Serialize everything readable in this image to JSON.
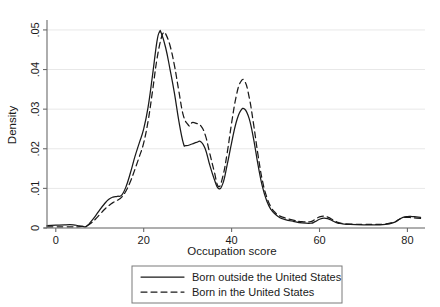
{
  "chart_data": {
    "type": "line",
    "title": "",
    "xlabel": "Occupation score",
    "ylabel": "Density",
    "xlim": [
      -2,
      84
    ],
    "ylim": [
      0,
      0.052
    ],
    "xticks": [
      0,
      20,
      40,
      60,
      80
    ],
    "xtick_labels": [
      "0",
      "20",
      "40",
      "60",
      "80"
    ],
    "yticks": [
      0,
      0.01,
      0.02,
      0.03,
      0.04,
      0.05
    ],
    "ytick_labels": [
      "0",
      ".01",
      ".02",
      ".03",
      ".04",
      ".05"
    ],
    "grid": "horizontal",
    "legend_position": "bottom-center",
    "series": [
      {
        "name": "Born outside the United States",
        "style": "solid",
        "color": "#1a1a1a",
        "points": [
          [
            -2,
            0.0006
          ],
          [
            0,
            0.0007
          ],
          [
            2,
            0.0008
          ],
          [
            4,
            0.0008
          ],
          [
            5,
            0.0006
          ],
          [
            6,
            0.0004
          ],
          [
            7,
            0.0004
          ],
          [
            8,
            0.0016
          ],
          [
            9,
            0.003
          ],
          [
            10,
            0.0046
          ],
          [
            11,
            0.006
          ],
          [
            12,
            0.0072
          ],
          [
            13,
            0.0078
          ],
          [
            14,
            0.008
          ],
          [
            15,
            0.0083
          ],
          [
            16,
            0.0105
          ],
          [
            17,
            0.014
          ],
          [
            18,
            0.018
          ],
          [
            19,
            0.0215
          ],
          [
            20,
            0.025
          ],
          [
            21,
            0.0305
          ],
          [
            22,
            0.0385
          ],
          [
            23,
            0.047
          ],
          [
            23.6,
            0.0495
          ],
          [
            24,
            0.0492
          ],
          [
            25,
            0.0455
          ],
          [
            26,
            0.04
          ],
          [
            27,
            0.034
          ],
          [
            28,
            0.027
          ],
          [
            29,
            0.0215
          ],
          [
            29.6,
            0.0208
          ],
          [
            31,
            0.0212
          ],
          [
            32,
            0.0216
          ],
          [
            33,
            0.0218
          ],
          [
            34,
            0.02
          ],
          [
            35,
            0.016
          ],
          [
            36,
            0.0125
          ],
          [
            37,
            0.01
          ],
          [
            38,
            0.0112
          ],
          [
            39,
            0.016
          ],
          [
            40,
            0.0215
          ],
          [
            41,
            0.0265
          ],
          [
            42,
            0.0295
          ],
          [
            43,
            0.03
          ],
          [
            44,
            0.0276
          ],
          [
            45,
            0.0225
          ],
          [
            46,
            0.016
          ],
          [
            47,
            0.0105
          ],
          [
            48,
            0.0068
          ],
          [
            49,
            0.0046
          ],
          [
            50,
            0.0034
          ],
          [
            51,
            0.0026
          ],
          [
            52,
            0.0022
          ],
          [
            54,
            0.0017
          ],
          [
            56,
            0.0013
          ],
          [
            58,
            0.0012
          ],
          [
            59,
            0.0016
          ],
          [
            60,
            0.0022
          ],
          [
            61,
            0.0025
          ],
          [
            62,
            0.0023
          ],
          [
            63,
            0.0018
          ],
          [
            64,
            0.0013
          ],
          [
            65,
            0.0011
          ],
          [
            67,
            0.0009
          ],
          [
            70,
            0.0008
          ],
          [
            73,
            0.0008
          ],
          [
            75,
            0.0009
          ],
          [
            77,
            0.0014
          ],
          [
            78,
            0.0021
          ],
          [
            79,
            0.0027
          ],
          [
            80,
            0.0029
          ],
          [
            81,
            0.0029
          ],
          [
            82,
            0.0028
          ],
          [
            83,
            0.0027
          ]
        ]
      },
      {
        "name": "Born in the United States",
        "style": "dashed",
        "color": "#1a1a1a",
        "points": [
          [
            -2,
            0.0003
          ],
          [
            0,
            0.0003
          ],
          [
            2,
            0.0003
          ],
          [
            4,
            0.0003
          ],
          [
            5,
            0.0003
          ],
          [
            6,
            0.0004
          ],
          [
            7,
            0.0006
          ],
          [
            8,
            0.0012
          ],
          [
            9,
            0.0022
          ],
          [
            10,
            0.0034
          ],
          [
            11,
            0.0046
          ],
          [
            12,
            0.0056
          ],
          [
            13,
            0.0064
          ],
          [
            14,
            0.007
          ],
          [
            15,
            0.0078
          ],
          [
            16,
            0.0094
          ],
          [
            17,
            0.0118
          ],
          [
            18,
            0.0148
          ],
          [
            19,
            0.018
          ],
          [
            20,
            0.0215
          ],
          [
            21,
            0.027
          ],
          [
            22,
            0.0345
          ],
          [
            23,
            0.0425
          ],
          [
            24,
            0.048
          ],
          [
            24.6,
            0.0493
          ],
          [
            25,
            0.049
          ],
          [
            26,
            0.046
          ],
          [
            27,
            0.041
          ],
          [
            28,
            0.0345
          ],
          [
            29,
            0.0285
          ],
          [
            30,
            0.0262
          ],
          [
            30.6,
            0.0258
          ],
          [
            31,
            0.0266
          ],
          [
            32,
            0.0264
          ],
          [
            33,
            0.0258
          ],
          [
            34,
            0.0235
          ],
          [
            35,
            0.019
          ],
          [
            36,
            0.0145
          ],
          [
            37,
            0.0105
          ],
          [
            38,
            0.013
          ],
          [
            39,
            0.019
          ],
          [
            40,
            0.0265
          ],
          [
            41,
            0.033
          ],
          [
            42,
            0.0368
          ],
          [
            43,
            0.037
          ],
          [
            44,
            0.033
          ],
          [
            45,
            0.0262
          ],
          [
            46,
            0.0185
          ],
          [
            47,
            0.012
          ],
          [
            48,
            0.0078
          ],
          [
            49,
            0.0052
          ],
          [
            50,
            0.0038
          ],
          [
            51,
            0.003
          ],
          [
            52,
            0.0026
          ],
          [
            54,
            0.002
          ],
          [
            56,
            0.0016
          ],
          [
            58,
            0.0016
          ],
          [
            59,
            0.0022
          ],
          [
            60,
            0.0028
          ],
          [
            61,
            0.003
          ],
          [
            62,
            0.0027
          ],
          [
            63,
            0.0021
          ],
          [
            64,
            0.0015
          ],
          [
            65,
            0.0012
          ],
          [
            67,
            0.001
          ],
          [
            70,
            0.0009
          ],
          [
            73,
            0.0009
          ],
          [
            75,
            0.001
          ],
          [
            77,
            0.0015
          ],
          [
            78,
            0.0021
          ],
          [
            79,
            0.0026
          ],
          [
            80,
            0.0027
          ],
          [
            81,
            0.0026
          ],
          [
            82,
            0.0025
          ],
          [
            83,
            0.0024
          ]
        ]
      }
    ]
  },
  "legend": {
    "entries": [
      {
        "label": "Born outside the United States",
        "style": "solid"
      },
      {
        "label": "Born in the United States",
        "style": "dashed"
      }
    ]
  }
}
